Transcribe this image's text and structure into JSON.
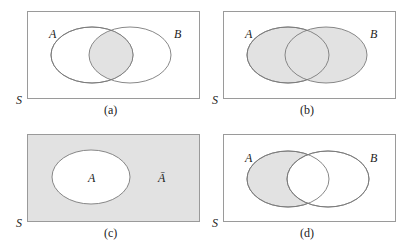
{
  "figure": {
    "universal_set_label": "S",
    "panels": [
      {
        "id": "a",
        "caption": "(a)",
        "set_labels": [
          "A",
          "B"
        ],
        "shaded_region": "A ∩ B",
        "colors": {
          "shade": "#e2e2e2",
          "outline": "#7a7a7a"
        }
      },
      {
        "id": "b",
        "caption": "(b)",
        "set_labels": [
          "A",
          "B"
        ],
        "shaded_region": "A ∪ B",
        "colors": {
          "shade": "#e2e2e2",
          "outline": "#7a7a7a"
        }
      },
      {
        "id": "c",
        "caption": "(c)",
        "set_labels": [
          "A",
          "Ā"
        ],
        "shaded_region": "complement of A",
        "colors": {
          "shade": "#e2e2e2",
          "outline": "#7a7a7a"
        }
      },
      {
        "id": "d",
        "caption": "(d)",
        "set_labels": [
          "A",
          "B"
        ],
        "shaded_region": "A − B",
        "colors": {
          "shade": "#e2e2e2",
          "outline": "#7a7a7a"
        }
      }
    ]
  }
}
